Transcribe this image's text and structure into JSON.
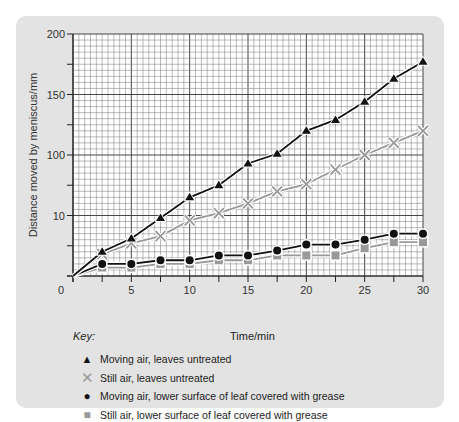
{
  "chart_data": {
    "type": "line",
    "title": "",
    "xlabel": "Time/min",
    "ylabel": "Distance moved by meniscus/mm",
    "xlim": [
      0,
      30
    ],
    "ylim": [
      0,
      200
    ],
    "x_ticks": [
      "0",
      "5",
      "10",
      "15",
      "20",
      "25",
      "30"
    ],
    "y_ticks": [
      "200",
      "150",
      "100",
      "10"
    ],
    "grid": true,
    "legend_title": "Key:",
    "legend_position": "bottom",
    "x": [
      0,
      2.5,
      5,
      7.5,
      10,
      12.5,
      15,
      17.5,
      20,
      22.5,
      25,
      27.5,
      30
    ],
    "series": [
      {
        "name": "Moving air, leaves untreated",
        "marker": "triangle",
        "color": "#111111",
        "values": [
          0,
          20,
          31,
          48,
          65,
          75,
          93,
          101,
          120,
          129,
          144,
          163,
          177
        ]
      },
      {
        "name": "Still air, leaves untreated",
        "marker": "cross",
        "color": "#999999",
        "values": [
          0,
          18,
          27,
          33,
          46,
          52,
          60,
          70,
          76,
          88,
          100,
          110,
          120
        ]
      },
      {
        "name": "Moving air, lower surface of leaf covered with grease",
        "marker": "circle",
        "color": "#111111",
        "values": [
          0,
          10,
          10,
          13,
          13,
          17,
          17,
          21,
          26,
          26,
          30,
          35,
          35
        ]
      },
      {
        "name": "Still air, lower surface of leaf covered with grease",
        "marker": "square",
        "color": "#999999",
        "values": [
          0,
          7,
          7,
          10,
          10,
          13,
          13,
          17,
          17,
          17,
          23,
          28,
          28
        ]
      }
    ]
  },
  "key": {
    "title": "Key:",
    "x_axis_label": "Time/min",
    "items": [
      {
        "symbol": "▲",
        "label": "Moving air, leaves untreated"
      },
      {
        "symbol": "✕",
        "label": "Still air, leaves untreated"
      },
      {
        "symbol": "●",
        "label": "Moving air, lower surface of leaf covered with grease"
      },
      {
        "symbol": "■",
        "label": "Still air, lower surface of leaf covered with grease"
      }
    ]
  }
}
